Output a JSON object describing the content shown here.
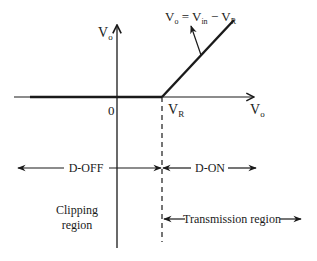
{
  "diagram": {
    "axes": {
      "vertical_label": "V",
      "vertical_label_sub": "o",
      "horizontal_label": "V",
      "horizontal_label_sub": "o",
      "origin_label": "0",
      "vr_label": "V",
      "vr_label_sub": "R"
    },
    "equation": {
      "lhs": "V",
      "lhs_sub": "o",
      "eq": " = ",
      "term1": "V",
      "term1_sub": "in",
      "minus": " − ",
      "term2": "V",
      "term2_sub": "R"
    },
    "regions": {
      "d_off": "D-OFF",
      "d_on": "D-ON",
      "clipping_line1": "Clipping",
      "clipping_line2": "region",
      "transmission": "Transmission region"
    },
    "colors": {
      "stroke": "#1a1a1a",
      "background": "#ffffff"
    }
  }
}
